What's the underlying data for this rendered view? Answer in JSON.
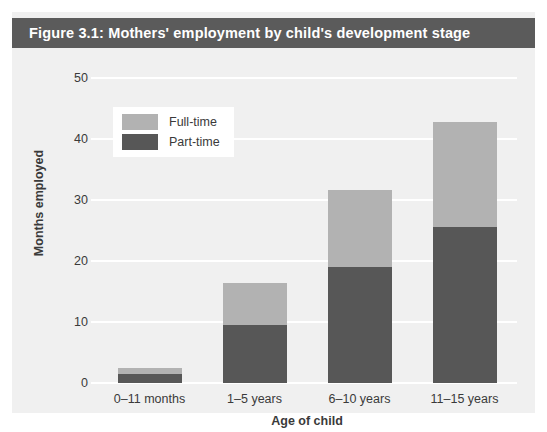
{
  "figure": {
    "title": "Figure 3.1: Mothers' employment by child's development stage",
    "title_bar_color": "#5b5b5b",
    "panel_background": "#f0f0f0"
  },
  "chart_data": {
    "type": "bar",
    "stacked": true,
    "title": "Figure 3.1: Mothers' employment by child's development stage",
    "xlabel": "Age of child",
    "ylabel": "Months employed",
    "ylim": [
      0,
      50
    ],
    "yticks": [
      0,
      10,
      20,
      30,
      40,
      50
    ],
    "ytick_labels": [
      "0",
      "10",
      "20",
      "30",
      "40",
      "50"
    ],
    "grid": true,
    "grid_color": "#ffffff",
    "legend_position": "upper left",
    "categories": [
      "0–11 months",
      "1–5 years",
      "6–10 years",
      "11–15 years"
    ],
    "series": [
      {
        "name": "Part-time",
        "color": "#575757",
        "values": [
          1.5,
          9.5,
          19.1,
          25.5
        ]
      },
      {
        "name": "Full-time",
        "color": "#b2b2b2",
        "values": [
          1.0,
          6.9,
          12.5,
          17.3
        ]
      }
    ],
    "totals": [
      2.5,
      16.4,
      31.6,
      42.8
    ]
  },
  "legend": {
    "items": [
      {
        "label": "Full-time",
        "color": "#b2b2b2"
      },
      {
        "label": "Part-time",
        "color": "#575757"
      }
    ]
  }
}
